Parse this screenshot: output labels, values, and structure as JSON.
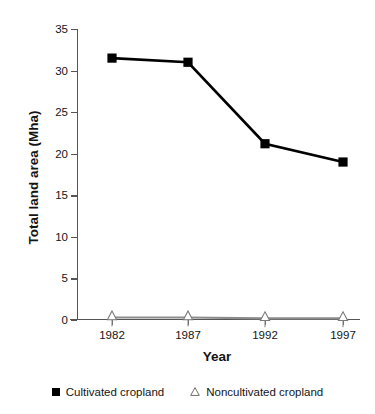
{
  "chart_data": {
    "type": "line",
    "title": "",
    "xlabel": "Year",
    "ylabel": "Total land area (Mha)",
    "categories": [
      "1982",
      "1987",
      "1992",
      "1997"
    ],
    "x": [
      1982,
      1987,
      1992,
      1997
    ],
    "xlim": [
      1980.5,
      1998.5
    ],
    "ylim": [
      0,
      35
    ],
    "yticks": [
      0,
      5,
      10,
      15,
      20,
      25,
      30,
      35
    ],
    "ytick_labels": [
      "0",
      "5",
      "10",
      "15",
      "20",
      "25",
      "30",
      "35"
    ],
    "grid": false,
    "legend_position": "bottom",
    "series": [
      {
        "name": "Cultivated cropland",
        "marker": "filled-square",
        "color": "#000000",
        "values": [
          31.5,
          31.0,
          21.2,
          19.0
        ]
      },
      {
        "name": "Noncultivated cropland",
        "marker": "open-triangle",
        "color": "#8c8c8c",
        "values": [
          0.3,
          0.3,
          0.2,
          0.2
        ]
      }
    ]
  },
  "legend": {
    "items": [
      {
        "label": "Cultivated cropland",
        "marker": "filled-square-icon"
      },
      {
        "label": "Noncultivated cropland",
        "marker": "open-triangle-icon"
      }
    ]
  }
}
